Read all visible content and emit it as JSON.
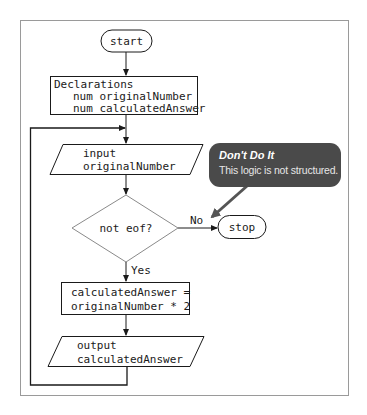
{
  "flowchart": {
    "start": {
      "label": "start"
    },
    "declarations": {
      "title": "Declarations",
      "lines": [
        "num originalNumber",
        "num calculatedAnswer"
      ]
    },
    "input": {
      "lines": [
        "input",
        "originalNumber"
      ]
    },
    "decision": {
      "label": "not eof?",
      "no_label": "No",
      "yes_label": "Yes"
    },
    "stop": {
      "label": "stop"
    },
    "calculation": {
      "lines": [
        "calculatedAnswer =",
        "originalNumber * 2"
      ]
    },
    "output": {
      "lines": [
        "output",
        "calculatedAnswer"
      ]
    }
  },
  "callout": {
    "title": "Don't Do It",
    "message": "This logic is not structured."
  },
  "colors": {
    "line": "#1a1a1a",
    "frame": "#9a9a9a",
    "callout_bg": "#4a4a4a",
    "callout_arrow": "#555555",
    "decision_border": "#8a8a8a"
  }
}
